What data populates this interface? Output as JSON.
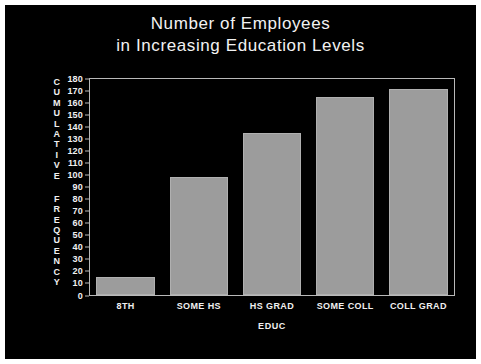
{
  "chart_data": {
    "type": "bar",
    "title": "Number of Employees in Increasing Education Levels",
    "title_lines": [
      "Number of Employees",
      "in Increasing Education Levels"
    ],
    "categories": [
      "8TH",
      "SOME HS",
      "HS GRAD",
      "SOME COLL",
      "COLL GRAD"
    ],
    "values": [
      15,
      98,
      135,
      165,
      172
    ],
    "xlabel": "EDUC",
    "ylabel": "CUMULATIVE FREQUENCY",
    "ylim": [
      0,
      180
    ],
    "ytick_step": 10,
    "yticks": [
      0,
      10,
      20,
      30,
      40,
      50,
      60,
      70,
      80,
      90,
      100,
      110,
      120,
      130,
      140,
      150,
      160,
      170,
      180
    ],
    "grid": false,
    "legend": null,
    "colors": {
      "background": "#000000",
      "page": "#ffffff",
      "bar_fill": "#9c9c9c",
      "bar_edge": "#b0b0b0",
      "text": "#f0f0f0",
      "axis": "#b9b9b9"
    }
  }
}
